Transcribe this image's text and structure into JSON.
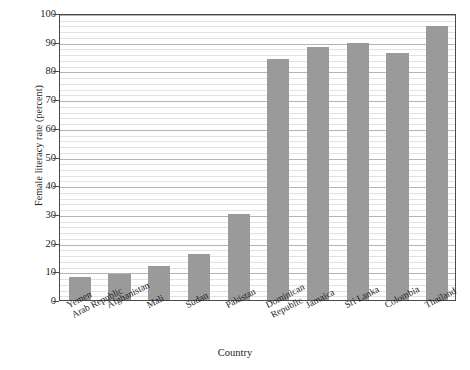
{
  "chart_data": {
    "type": "bar",
    "title": "",
    "xlabel": "Country",
    "ylabel": "Female literacy rate (percent)",
    "categories": [
      "Yemen Arab Republic",
      "Afghanistan",
      "Mali",
      "Sudan",
      "Pakistan",
      "Dominican Republic",
      "Jamaica",
      "Sri Lanka",
      "Colombia",
      "Thailand"
    ],
    "category_lines": [
      [
        "Yemen",
        "Arab Republic"
      ],
      [
        "Afghanistan",
        ""
      ],
      [
        "Mali",
        ""
      ],
      [
        "Sudan",
        ""
      ],
      [
        "Pakistan",
        ""
      ],
      [
        "Dominican",
        "Republic"
      ],
      [
        "Jamaica",
        ""
      ],
      [
        "Sri Lanka",
        ""
      ],
      [
        "Colombia",
        ""
      ],
      [
        "Thailand",
        ""
      ]
    ],
    "values": [
      8,
      9,
      12,
      16,
      30,
      84,
      88,
      89.5,
      86,
      95.5
    ],
    "ylim": [
      0,
      100
    ],
    "xlim": [
      0,
      10
    ],
    "ytick_values": [
      0,
      10,
      20,
      30,
      40,
      50,
      60,
      70,
      80,
      90,
      100
    ],
    "ytick_labels": [
      "0",
      "10",
      "20",
      "30",
      "40",
      "50",
      "60",
      "70",
      "80",
      "90",
      "100"
    ],
    "minor_gridline_step": 2,
    "major_gridline_step": 10,
    "grid": true,
    "legend": null,
    "bar_color": "#9a9a9a",
    "gridline_color": "#e2e2e2",
    "major_gridline_color": "#b4b4b4",
    "frame_color": "#4a4a4a",
    "background_color": "#ffffff"
  }
}
